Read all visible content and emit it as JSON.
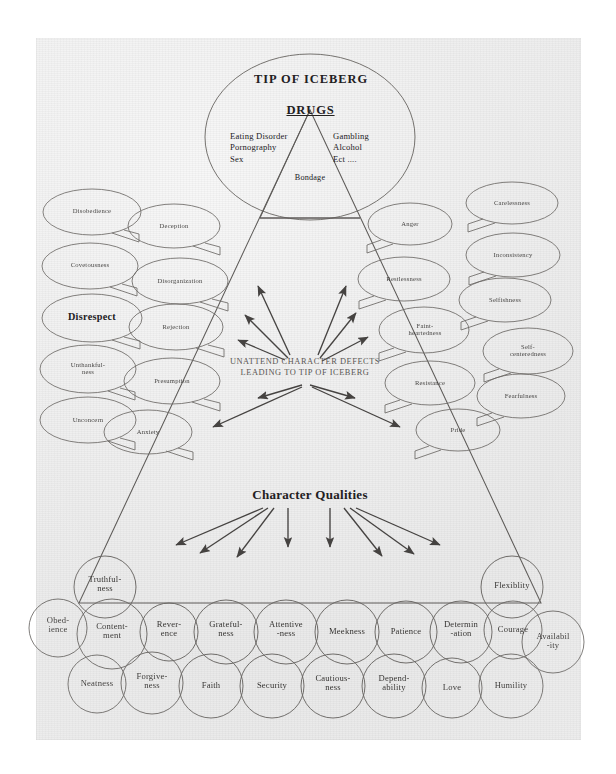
{
  "iceberg": {
    "tip_label": "TIP OF ICEBERG",
    "drugs_label": "DRUGS",
    "left_list": [
      "Eating Disorder",
      "Pornography",
      "Sex"
    ],
    "right_list": [
      "Gambling",
      "Alcohol",
      "Ect ...."
    ],
    "bondage_label": "Bondage"
  },
  "center": {
    "line1": "UNATTEND CHARACTER DEFECTS",
    "line2": "LEADING TO TIP OF ICEBERG"
  },
  "qualities_heading": "Character Qualities",
  "defects": {
    "left_outer": [
      "Disobedience",
      "Covetousness",
      "Disrespect",
      "Unthankful-",
      "ness",
      "Unconcern"
    ],
    "left_outer_items": [
      {
        "label": "Disobedience"
      },
      {
        "label": "Covetousness"
      },
      {
        "label": "Disrespect"
      },
      {
        "label": "Unthankful-\nness"
      },
      {
        "label": "Unconcern"
      }
    ],
    "left_inner_items": [
      {
        "label": "Deception"
      },
      {
        "label": "Disorganization"
      },
      {
        "label": "Rejection"
      },
      {
        "label": "Presumption"
      },
      {
        "label": "Anxiety"
      }
    ],
    "right_inner_items": [
      {
        "label": "Anger"
      },
      {
        "label": "Restlessness"
      },
      {
        "label": "Faint-\nheartedness"
      },
      {
        "label": "Resistance"
      },
      {
        "label": "Pride"
      }
    ],
    "right_outer_items": [
      {
        "label": "Carelessness"
      },
      {
        "label": "Inconsistency"
      },
      {
        "label": "Selfishness"
      },
      {
        "label": "Self-\ncenteredness"
      },
      {
        "label": "Fearfulness"
      }
    ]
  },
  "qualities": {
    "top_row": [
      {
        "label": "Truthful-\nness"
      },
      {
        "label": "Flexiblity"
      }
    ],
    "middle_row": [
      {
        "label": "Obed-\nience"
      },
      {
        "label": "Content-\nment"
      },
      {
        "label": "Rever-\nence"
      },
      {
        "label": "Grateful-\nness"
      },
      {
        "label": "Attentive\n-ness"
      },
      {
        "label": "Meekness"
      },
      {
        "label": "Patience"
      },
      {
        "label": "Determin\n-ation"
      },
      {
        "label": "Courage"
      },
      {
        "label": "Availabil\n-ity"
      }
    ],
    "bottom_row": [
      {
        "label": "Neatness"
      },
      {
        "label": "Forgive-\nness"
      },
      {
        "label": "Faith"
      },
      {
        "label": "Security"
      },
      {
        "label": "Cautious-\nness"
      },
      {
        "label": "Depend-\nability"
      },
      {
        "label": "Love"
      },
      {
        "label": "Humility"
      }
    ]
  },
  "colors": {
    "ink": "#3a3734",
    "paper": "#eeeeee",
    "text": "#22201e"
  }
}
